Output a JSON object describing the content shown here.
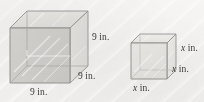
{
  "figure": {
    "background_color": "#f4f3f1",
    "ink_color": "#6f6e6c",
    "label_color": "#3b3a38"
  },
  "shapes": [
    {
      "name": "large-cube",
      "kind": "cube",
      "edge_length": "9 in.",
      "fill": "#d9d8d5",
      "labels": [
        {
          "id": "height",
          "text": "9 in.",
          "position": "right-vertical-edge"
        },
        {
          "id": "depth",
          "text": "9 in.",
          "position": "bottom-right-receding-edge"
        },
        {
          "id": "width",
          "text": "9 in.",
          "position": "bottom-front-edge"
        }
      ]
    },
    {
      "name": "small-cube",
      "kind": "cube",
      "edge_length": "x in.",
      "fill": "#e6e5e2",
      "labels": [
        {
          "id": "height",
          "text": "x in.",
          "position": "right-vertical-edge"
        },
        {
          "id": "depth",
          "text": "x in.",
          "position": "bottom-right-receding-edge"
        },
        {
          "id": "width",
          "text": "x in.",
          "position": "bottom-front-edge"
        }
      ]
    }
  ],
  "labels": {
    "large_height": {
      "value": "9",
      "unit": "in."
    },
    "large_depth": {
      "value": "9",
      "unit": "in."
    },
    "large_width": {
      "value": "9",
      "unit": "in."
    },
    "small_height": {
      "value": "x",
      "unit": "in."
    },
    "small_depth": {
      "value": "x",
      "unit": "in."
    },
    "small_width": {
      "value": "x",
      "unit": "in."
    }
  }
}
